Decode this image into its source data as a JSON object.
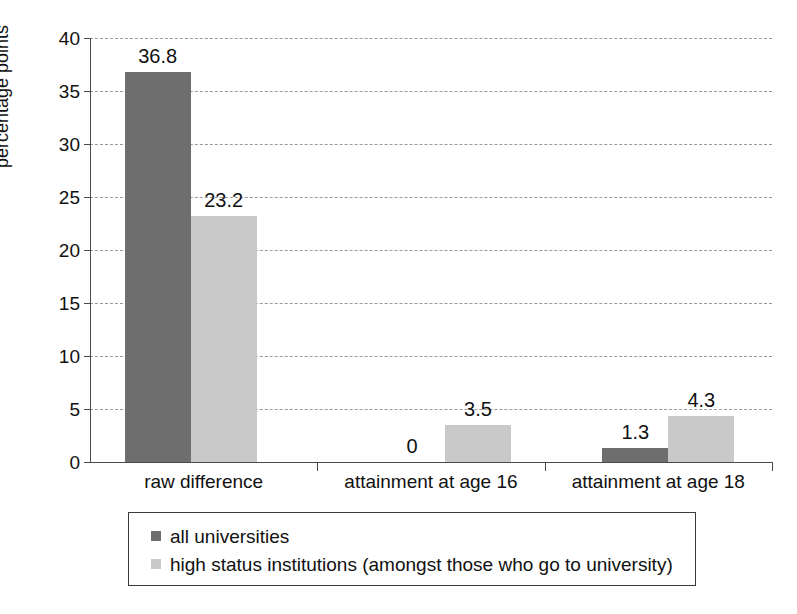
{
  "chart_data": {
    "type": "bar",
    "title": "",
    "subtitle": "",
    "xlabel": "",
    "ylabel": "percentage points",
    "ylim": [
      0,
      40
    ],
    "ytick_step": 5,
    "yticks": [
      "0",
      "5",
      "10",
      "15",
      "20",
      "25",
      "30",
      "35",
      "40"
    ],
    "grid": true,
    "grid_axis": "y",
    "legend_position": "bottom",
    "categories": [
      "raw difference",
      "attainment at age 16",
      "attainment at age 18"
    ],
    "series": [
      {
        "name": "all universities",
        "color": "#6e6e6e",
        "values": [
          36.8,
          0,
          1.3
        ],
        "labels": [
          "36.8",
          "0",
          "1.3"
        ]
      },
      {
        "name": "high status institutions (amongst those who go to university)",
        "color": "#c9c9c9",
        "values": [
          23.2,
          3.5,
          4.3
        ],
        "labels": [
          "23.2",
          "3.5",
          "4.3"
        ]
      }
    ]
  },
  "axis": {
    "y_title": "percentage points",
    "ticks": [
      {
        "label": "40",
        "value": 40
      },
      {
        "label": "35",
        "value": 35
      },
      {
        "label": "30",
        "value": 30
      },
      {
        "label": "25",
        "value": 25
      },
      {
        "label": "20",
        "value": 20
      },
      {
        "label": "15",
        "value": 15
      },
      {
        "label": "10",
        "value": 10
      },
      {
        "label": "5",
        "value": 5
      },
      {
        "label": "0",
        "value": 0
      }
    ]
  },
  "legend": {
    "items": [
      {
        "label": "all universities",
        "color": "#6e6e6e"
      },
      {
        "label": "high status institutions (amongst those who go to university)",
        "color": "#c9c9c9"
      }
    ]
  },
  "colors": {
    "series_dark": "#6e6e6e",
    "series_light": "#c9c9c9",
    "gridline": "#9a9a9a",
    "axis": "#4a4a4a",
    "text": "#111111",
    "background": "#ffffff"
  }
}
